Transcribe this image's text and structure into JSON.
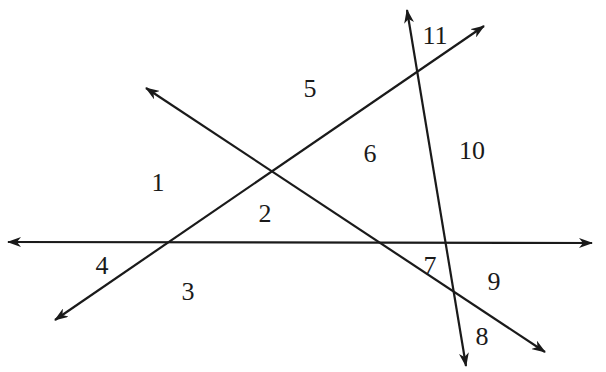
{
  "diagram": {
    "type": "intersecting-lines-angle-diagram",
    "stroke_color": "#1a1a1a",
    "background": "#ffffff",
    "lines": [
      {
        "id": "horizontal-line",
        "from": [
          8,
          242
        ],
        "to": [
          592,
          243
        ],
        "arrows": "both"
      },
      {
        "id": "rising-line",
        "from": [
          55,
          320
        ],
        "to": [
          484,
          26
        ],
        "arrows": "both"
      },
      {
        "id": "falling-line",
        "from": [
          146,
          88
        ],
        "to": [
          545,
          352
        ],
        "arrows": "both"
      },
      {
        "id": "steep-line",
        "from": [
          407,
          10
        ],
        "to": [
          466,
          366
        ],
        "arrows": "both"
      }
    ],
    "labels": [
      {
        "text": "1",
        "x": 158,
        "y": 182
      },
      {
        "text": "2",
        "x": 265,
        "y": 213
      },
      {
        "text": "3",
        "x": 188,
        "y": 291
      },
      {
        "text": "4",
        "x": 102,
        "y": 265
      },
      {
        "text": "5",
        "x": 310,
        "y": 88
      },
      {
        "text": "6",
        "x": 370,
        "y": 153
      },
      {
        "text": "7",
        "x": 430,
        "y": 265
      },
      {
        "text": "8",
        "x": 482,
        "y": 336
      },
      {
        "text": "9",
        "x": 494,
        "y": 281
      },
      {
        "text": "10",
        "x": 472,
        "y": 150
      },
      {
        "text": "11",
        "x": 435,
        "y": 35
      }
    ]
  }
}
